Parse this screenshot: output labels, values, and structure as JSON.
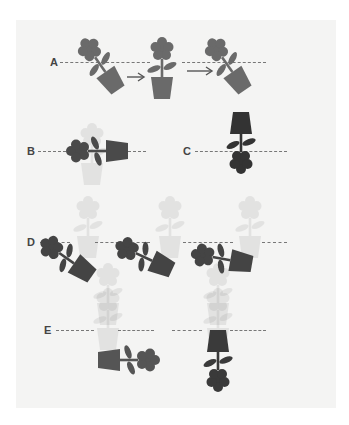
{
  "figure": {
    "rows": [
      {
        "label": "A",
        "description": "Pot tilts, then becomes upright, then tilts again",
        "arrows": 2
      },
      {
        "label": "B",
        "description": "Plant lying horizontal, flower left, pot right"
      },
      {
        "label": "C",
        "description": "Plant inverted, pot on top, flower below"
      },
      {
        "label": "D",
        "description": "Three plants progressively rotating toward horizontal, with faint ghost plants"
      },
      {
        "label": "E",
        "description": "Horizontal plant and inverted plant with faint upright ghost plants above"
      }
    ],
    "colors": {
      "background": "#f4f4f3",
      "plant_medium": "#6a6a6a",
      "plant_dark": "#3a3a3a",
      "dashed_line": "#777777"
    }
  }
}
